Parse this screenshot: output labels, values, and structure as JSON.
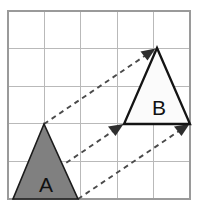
{
  "figure": {
    "background_color": "#ffffff",
    "width": 199,
    "height": 206
  },
  "grid": {
    "name": "square-grid",
    "columns": 5,
    "rows": 5,
    "cell_size": 36.4,
    "left": 8,
    "top": 11,
    "right": 190,
    "bottom": 199,
    "line_color": "#b9b9b9",
    "border_color": "#9a9a9a",
    "vertical_lines": [
      8,
      44.4,
      80.8,
      117.2,
      153.6,
      190
    ],
    "horizontal_lines": [
      11,
      48.6,
      86.2,
      123.8,
      161.4,
      199
    ]
  },
  "shapes": [
    {
      "name": "triangle-a",
      "label": "A",
      "fill_color": "#808080",
      "stroke_color": "#1b1b1b",
      "points": "44,124 13,199 78,199",
      "label_x": 46,
      "label_y": 192
    },
    {
      "name": "triangle-b",
      "label": "B",
      "fill_color": "#fbfbfb",
      "stroke_color": "#141414",
      "points": "157,48 124,124 190,124",
      "label_x": 159,
      "label_y": 115
    }
  ],
  "vectors": [
    {
      "name": "translation-arrow-apex",
      "from_x": 44,
      "from_y": 124,
      "to_x": 157,
      "to_y": 48,
      "line": "M 44 124 L 152 51",
      "head": "155.5,48.5 140.5,51.5 147.5,60.5",
      "color": "#4a4a4a"
    },
    {
      "name": "translation-arrow-left-base",
      "from_x": 13,
      "from_y": 199,
      "to_x": 124,
      "to_y": 124,
      "line": "M 13 199 L 119 127",
      "head": "123.5,124.0 108.0,126.5 115.5,136.0",
      "color": "#4a4a4a"
    },
    {
      "name": "translation-arrow-right-base",
      "from_x": 78,
      "from_y": 199,
      "to_x": 190,
      "to_y": 124,
      "line": "M 78 199 L 185 127",
      "head": "189.5,124.0 174.0,126.5 181.5,136.0",
      "color": "#4a4a4a"
    }
  ]
}
